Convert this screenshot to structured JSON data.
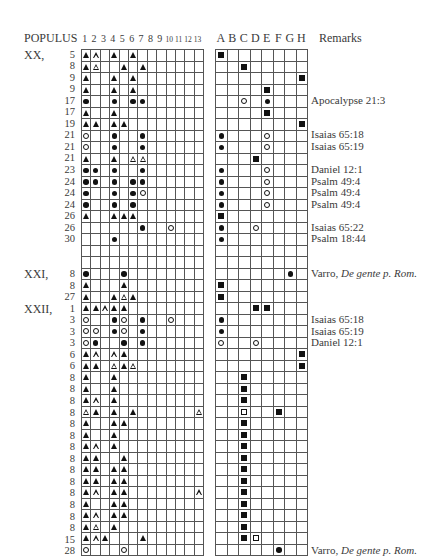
{
  "header": {
    "populus_label": "POPULUS",
    "column_numbers": [
      "1",
      "2",
      "3",
      "4",
      "5",
      "6",
      "7",
      "8",
      "9",
      "10",
      "11",
      "12",
      "13"
    ],
    "column_letters": [
      "A",
      "B",
      "C",
      "D",
      "E",
      "F",
      "G",
      "H"
    ],
    "remarks_label": "Remarks"
  },
  "legend_symbols": {
    "T": "filled-triangle",
    "t": "open-triangle",
    "D": "filled-circle",
    "d": "open-circle",
    "S": "filled-square",
    "s": "open-square"
  },
  "sections": [
    {
      "label": "XX,",
      "start_row": 0
    },
    {
      "label": "XXI,",
      "start_row": 19
    },
    {
      "label": "XXII,",
      "start_row": 22
    }
  ],
  "rows": [
    {
      "num": "5",
      "left": "Tt.T.T.......",
      "right": "S.......",
      "remark": ""
    },
    {
      "num": "8",
      "left": "Tt..T.T......",
      "right": "..S.....",
      "remark": ""
    },
    {
      "num": "9",
      "left": "T..T.T.......",
      "right": ".......S",
      "remark": ""
    },
    {
      "num": "9",
      "left": "T..T.T.......",
      "right": "....S...",
      "remark": ""
    },
    {
      "num": "17",
      "left": "D..D.DD......",
      "right": "..d.D...",
      "remark": "Apocalypse 21:3"
    },
    {
      "num": "17",
      "left": "T..T.........",
      "right": "....S...",
      "remark": ""
    },
    {
      "num": "19",
      "left": "TT.TT........",
      "right": ".......S",
      "remark": ""
    },
    {
      "num": "21",
      "left": "d..D..D......",
      "right": "D...d...",
      "remark": "Isaias 65:18"
    },
    {
      "num": "21",
      "left": "d..D..D......",
      "right": "D...d...",
      "remark": "Isaias 65:19"
    },
    {
      "num": "21",
      "left": "T..T.tt......",
      "right": "...S....",
      "remark": ""
    },
    {
      "num": "23",
      "left": "DD.D..D......",
      "right": "D...d...",
      "remark": "Daniel 12:1"
    },
    {
      "num": "24",
      "left": "DD.D.DD......",
      "right": "D...d...",
      "remark": "Psalm 49:4"
    },
    {
      "num": "24",
      "left": "D..D.Dd......",
      "right": "D...d...",
      "remark": "Psalm 49:4"
    },
    {
      "num": "24",
      "left": "D..D.D.......",
      "right": "D...d...",
      "remark": "Psalm 49:4"
    },
    {
      "num": "26",
      "left": "T..TTT.......",
      "right": "S.......",
      "remark": ""
    },
    {
      "num": "26",
      "left": "......D..d...",
      "right": "D..d....",
      "remark": "Isaias 65:22"
    },
    {
      "num": "30",
      "left": "...D.........",
      "right": "D.......",
      "remark": "Psalm 18:44"
    },
    {
      "num": "",
      "left": ".............",
      "right": "........",
      "remark": ""
    },
    {
      "num": "",
      "left": ".............",
      "right": "........",
      "remark": ""
    },
    {
      "num": "8",
      "left": "D...D........",
      "right": "......D.",
      "remark": "Varro, ",
      "remark_italic": "De gente p. Rom."
    },
    {
      "num": "8",
      "left": "T...T........",
      "right": "S.......",
      "remark": ""
    },
    {
      "num": "27",
      "left": "T..TtT.......",
      "right": "S.......",
      "remark": ""
    },
    {
      "num": "1",
      "left": "TTtTT........",
      "right": "...SS...",
      "remark": ""
    },
    {
      "num": "3",
      "left": "d..Dd.D..d...",
      "right": "D.......",
      "remark": "Isaias 65:18"
    },
    {
      "num": "3",
      "left": "dd.Dd.D......",
      "right": "D.......",
      "remark": "Isaias 65:19"
    },
    {
      "num": "3",
      "left": "dD..D.D......",
      "right": "d..d....",
      "remark": "Daniel 12:1"
    },
    {
      "num": "6",
      "left": "Tt.tT........",
      "right": ".......S",
      "remark": ""
    },
    {
      "num": "6",
      "left": "TT.tTt.......",
      "right": ".......S",
      "remark": ""
    },
    {
      "num": "8",
      "left": "T..T.........",
      "right": "..S.....",
      "remark": ""
    },
    {
      "num": "8",
      "left": "T..T.........",
      "right": "..S.....",
      "remark": ""
    },
    {
      "num": "8",
      "left": "Tt.T.........",
      "right": "..S.....",
      "remark": ""
    },
    {
      "num": "8",
      "left": "tT.T.T......t",
      "right": "..s..S..",
      "remark": ""
    },
    {
      "num": "8",
      "left": "T..TT........",
      "right": "..S.....",
      "remark": ""
    },
    {
      "num": "8",
      "left": "T..T.........",
      "right": "..S.....",
      "remark": ""
    },
    {
      "num": "8",
      "left": "Tt.T.........",
      "right": "..S.....",
      "remark": ""
    },
    {
      "num": "8",
      "left": "TT..T........",
      "right": "..S.....",
      "remark": ""
    },
    {
      "num": "8",
      "left": "TT.TT........",
      "right": "..S.....",
      "remark": ""
    },
    {
      "num": "8",
      "left": "TT.TT........",
      "right": "..S.....",
      "remark": ""
    },
    {
      "num": "8",
      "left": "Tt.TT.......t",
      "right": "..S.....",
      "remark": ""
    },
    {
      "num": "8",
      "left": "T..TT........",
      "right": "..S.....",
      "remark": ""
    },
    {
      "num": "8",
      "left": "Tt.TT........",
      "right": "..S.....",
      "remark": ""
    },
    {
      "num": "8",
      "left": "Tt.T.........",
      "right": "..S.....",
      "remark": ""
    },
    {
      "num": "15",
      "left": "TtT...T......",
      "right": "..Ss....",
      "remark": ""
    },
    {
      "num": "28",
      "left": "d...d........",
      "right": ".....D..",
      "remark": "Varro, ",
      "remark_italic": "De gente p. Rom."
    }
  ]
}
